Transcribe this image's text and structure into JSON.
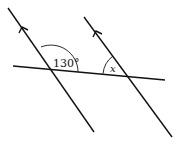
{
  "diagram": {
    "type": "geometry-parallel-lines",
    "stroke_color": "#111111",
    "background": "#ffffff",
    "parallel_lines": [
      {
        "id": "line-1",
        "from": [
          8,
          8
        ],
        "to": [
          94,
          132
        ],
        "arrow_at": [
          22,
          28
        ]
      },
      {
        "id": "line-2",
        "from": [
          84,
          17
        ],
        "to": [
          172,
          137
        ],
        "arrow_at": [
          96,
          32
        ]
      }
    ],
    "transversal": {
      "from": [
        13,
        66
      ],
      "to": [
        165,
        80
      ]
    },
    "angles": [
      {
        "id": "angle-130",
        "label": "130°",
        "vertex": [
          51,
          69
        ]
      },
      {
        "id": "angle-x",
        "label": "x",
        "vertex": [
          128,
          76
        ]
      }
    ]
  }
}
